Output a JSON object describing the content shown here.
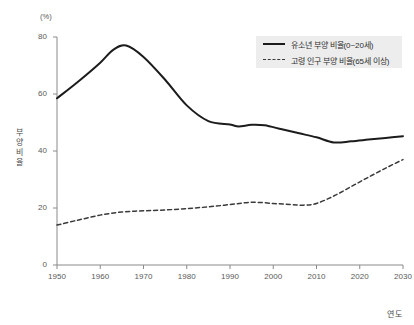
{
  "chart_data": {
    "type": "line",
    "title": "",
    "xlabel": "연도",
    "ylabel": "부양 비율",
    "unit_label": "(%)",
    "xlim": [
      1950,
      2030
    ],
    "ylim": [
      0,
      80
    ],
    "grid": false,
    "legend_position": "top-right",
    "xticks": [
      "1950",
      "1960",
      "1970",
      "1980",
      "1990",
      "2000",
      "2010",
      "2020",
      "2030"
    ],
    "yticks": [
      "0",
      "20",
      "40",
      "60",
      "80"
    ],
    "series": [
      {
        "name": "유소년 부양 비율(0~20세)",
        "style": "solid",
        "color": "#1c1c1c",
        "x": [
          1950,
          1955,
          1960,
          1963,
          1966,
          1970,
          1975,
          1980,
          1985,
          1990,
          1992,
          1995,
          1998,
          2002,
          2006,
          2010,
          2014,
          2018,
          2022,
          2026,
          2030
        ],
        "values": [
          58.5,
          64.5,
          71.0,
          75.5,
          77.0,
          73.0,
          65.0,
          56.0,
          50.5,
          49.3,
          48.6,
          49.2,
          49.0,
          47.6,
          46.2,
          44.8,
          43.0,
          43.4,
          44.0,
          44.6,
          45.2
        ]
      },
      {
        "name": "고령 인구 부양 비율(65세 이상)",
        "style": "dashed",
        "color": "#3a3a3a",
        "x": [
          1950,
          1955,
          1960,
          1965,
          1970,
          1975,
          1980,
          1985,
          1990,
          1995,
          2000,
          2004,
          2007,
          2010,
          2014,
          2018,
          2022,
          2026,
          2030
        ],
        "values": [
          14.0,
          15.8,
          17.5,
          18.6,
          19.0,
          19.3,
          19.8,
          20.4,
          21.2,
          22.0,
          21.6,
          21.2,
          21.0,
          21.6,
          24.2,
          27.5,
          30.8,
          34.0,
          37.0
        ]
      }
    ]
  },
  "legend": {
    "items": [
      {
        "label": "유소년 부양 비율(0~20세)",
        "style": "solid"
      },
      {
        "label": "고령 인구 부양 비율(65세 이상)",
        "style": "dashed"
      }
    ]
  }
}
